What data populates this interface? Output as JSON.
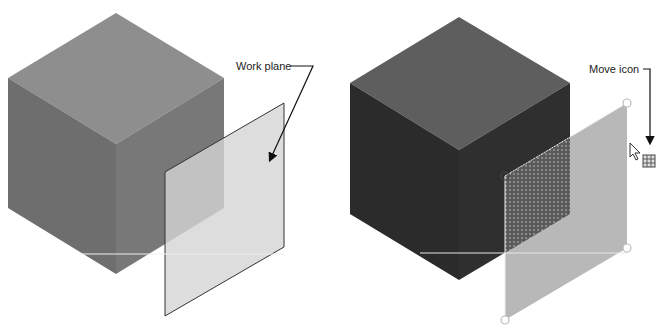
{
  "panels": [
    {
      "id": "left",
      "callout": "Work plane",
      "colors": {
        "cube_top": "#8e8e8e",
        "cube_left": "#6e6e6e",
        "cube_right": "#787878",
        "plane_fill": "#d4d4d4",
        "plane_stroke": "#333333"
      }
    },
    {
      "id": "right",
      "callout": "Move icon",
      "colors": {
        "cube_top": "#5e5e5e",
        "cube_left": "#2b2b2b",
        "cube_right": "#2f2f2f",
        "plane_fill": "#b8b8b8",
        "plane_overlap": "#6a6a6a",
        "grip": "#ffffff"
      }
    }
  ]
}
